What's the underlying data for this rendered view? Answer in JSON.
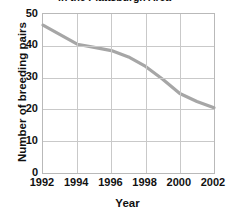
{
  "chart_data": {
    "type": "line",
    "title": "in the Plattsburgh Area",
    "xlabel": "Year",
    "ylabel": "Number of breeding pairs",
    "x": [
      1992,
      1993,
      1994,
      1995,
      1996,
      1997,
      1998,
      1999,
      2000,
      2001,
      2002
    ],
    "values": [
      46.5,
      43.5,
      40.5,
      39.5,
      38.5,
      36.5,
      33.5,
      29.5,
      25,
      22.5,
      20.5
    ],
    "series": [
      {
        "name": "Number of breeding pairs",
        "values": [
          46.5,
          43.5,
          40.5,
          39.5,
          38.5,
          36.5,
          33.5,
          29.5,
          25,
          22.5,
          20.5
        ]
      }
    ],
    "xlim": [
      1992,
      2002
    ],
    "ylim": [
      0,
      50
    ],
    "xticks": [
      "1992",
      "1994",
      "1996",
      "1998",
      "2000",
      "2002"
    ],
    "xtick_values": [
      1992,
      1994,
      1996,
      1998,
      2000,
      2002
    ],
    "yticks": [
      "0",
      "10",
      "20",
      "30",
      "40",
      "50"
    ],
    "ytick_values": [
      0,
      10,
      20,
      30,
      40,
      50
    ],
    "grid": true,
    "legend": false,
    "line_color": "#a6a6a6",
    "grid_color": "#c9c9c9",
    "axis_color": "#b9b9b9",
    "text_color": "#111111"
  }
}
